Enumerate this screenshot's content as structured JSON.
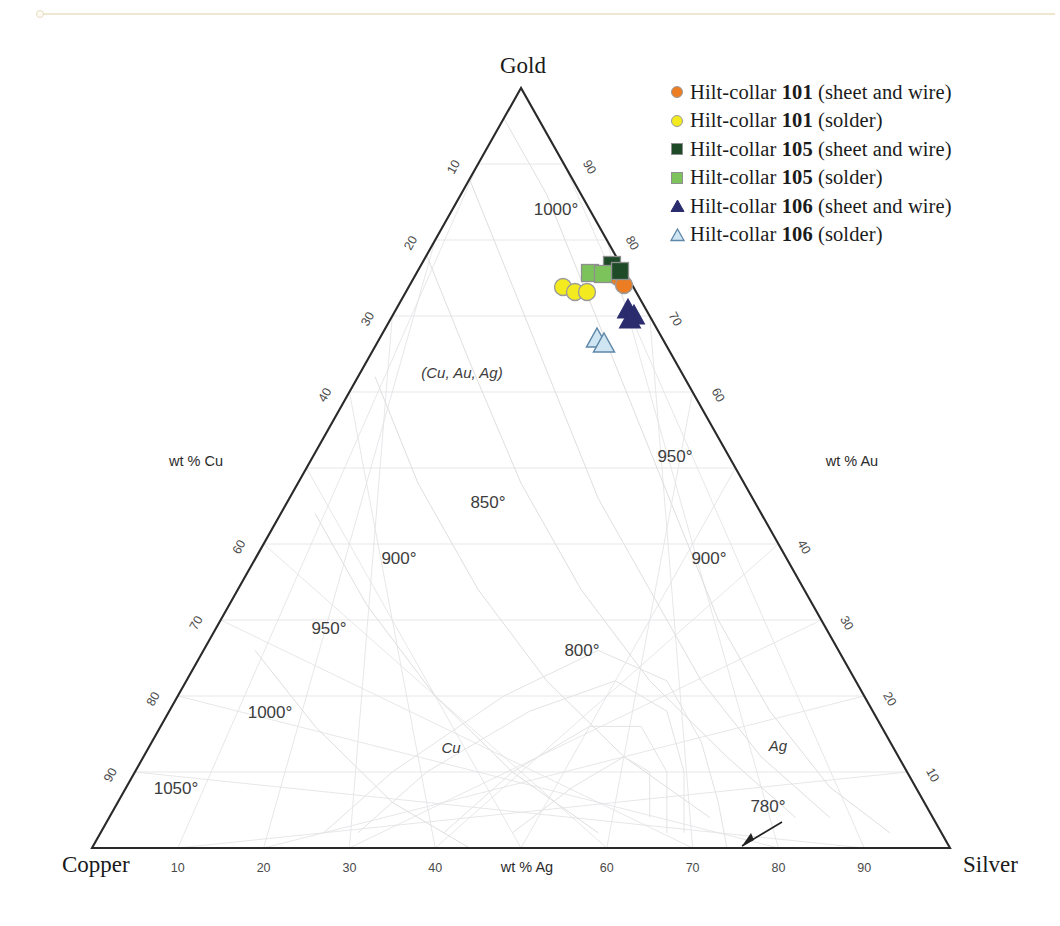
{
  "chart_data": {
    "type": "scatter",
    "plot_kind": "ternary",
    "title": "",
    "corners": {
      "top": "Gold",
      "bottom_left": "Copper",
      "bottom_right": "Silver"
    },
    "axes": [
      {
        "name": "left",
        "label": "wt % Cu",
        "ticks": [
          10,
          20,
          30,
          40,
          60,
          70,
          80,
          90
        ]
      },
      {
        "name": "right",
        "label": "wt % Au",
        "ticks": [
          10,
          20,
          30,
          40,
          60,
          70,
          80,
          90
        ]
      },
      {
        "name": "bottom",
        "label": "wt % Ag",
        "ticks": [
          10,
          20,
          30,
          40,
          60,
          70,
          80,
          90
        ]
      }
    ],
    "isotherm_labels": [
      {
        "text": "1000°",
        "x": 556,
        "y": 215
      },
      {
        "text": "950°",
        "x": 675,
        "y": 462
      },
      {
        "text": "850°",
        "x": 488,
        "y": 508
      },
      {
        "text": "900°",
        "x": 399,
        "y": 564
      },
      {
        "text": "900°",
        "x": 709,
        "y": 564
      },
      {
        "text": "950°",
        "x": 329,
        "y": 634
      },
      {
        "text": "800°",
        "x": 582,
        "y": 656
      },
      {
        "text": "1000°",
        "x": 270,
        "y": 718
      },
      {
        "text": "1050°",
        "x": 176,
        "y": 794
      },
      {
        "text": "780°",
        "x": 768,
        "y": 812
      }
    ],
    "phase_labels": [
      {
        "text": "(Cu, Au, Ag)",
        "x": 462,
        "y": 378
      },
      {
        "text": "Cu",
        "x": 451,
        "y": 753
      },
      {
        "text": "Ag",
        "x": 778,
        "y": 751
      }
    ],
    "legend_position": "top-right",
    "legend": [
      {
        "label_prefix": "Hilt-collar ",
        "label_bold": "101",
        "label_suffix": " (sheet and wire)",
        "marker": "circle",
        "fill": "#ED7D22",
        "stroke": "#9a9a9a",
        "series": "hilt-collar-101-sheet-and-wire"
      },
      {
        "label_prefix": "Hilt-collar ",
        "label_bold": "101",
        "label_suffix": " (solder)",
        "marker": "circle",
        "fill": "#F3EB1F",
        "stroke": "#9a9a9a",
        "series": "hilt-collar-101-solder"
      },
      {
        "label_prefix": "Hilt-collar ",
        "label_bold": "105",
        "label_suffix": " (sheet and wire)",
        "marker": "square",
        "fill": "#1E4A27",
        "stroke": "#8f8f8f",
        "series": "hilt-collar-105-sheet-and-wire"
      },
      {
        "label_prefix": "Hilt-collar ",
        "label_bold": "105",
        "label_suffix": " (solder)",
        "marker": "square",
        "fill": "#7CC35B",
        "stroke": "#8f8f8f",
        "series": "hilt-collar-105-solder"
      },
      {
        "label_prefix": "Hilt-collar ",
        "label_bold": "106",
        "label_suffix": " (sheet and wire)",
        "marker": "triangle",
        "fill": "#2B2C6E",
        "stroke": "#2B2C6E",
        "series": "hilt-collar-106-sheet-and-wire"
      },
      {
        "label_prefix": "Hilt-collar ",
        "label_bold": "106",
        "label_suffix": " (solder)",
        "marker": "triangle-open",
        "fill": "#CFE6F2",
        "stroke": "#5E87A8",
        "series": "hilt-collar-106-solder"
      }
    ],
    "series": [
      {
        "name": "Hilt-collar 101 (sheet and wire)",
        "marker": "circle",
        "fill": "#ED7D22",
        "stroke": "#9a9a9a",
        "points": [
          {
            "px": 618,
            "py": 277,
            "Ag": 17,
            "Au": 73,
            "Cu": 10
          },
          {
            "px": 624,
            "py": 285,
            "Ag": 18,
            "Au": 72,
            "Cu": 10
          }
        ]
      },
      {
        "name": "Hilt-collar 101 (solder)",
        "marker": "circle",
        "fill": "#F3EB1F",
        "stroke": "#9a9a9a",
        "points": [
          {
            "px": 563,
            "py": 287,
            "Ag": 13,
            "Au": 72,
            "Cu": 15
          },
          {
            "px": 575,
            "py": 292,
            "Ag": 14,
            "Au": 71,
            "Cu": 15
          },
          {
            "px": 587,
            "py": 292,
            "Ag": 15,
            "Au": 71,
            "Cu": 14
          }
        ]
      },
      {
        "name": "Hilt-collar 105 (sheet and wire)",
        "marker": "square",
        "fill": "#1E4A27",
        "stroke": "#8f8f8f",
        "points": [
          {
            "px": 612,
            "py": 265,
            "Ag": 17,
            "Au": 74,
            "Cu": 9
          },
          {
            "px": 620,
            "py": 271,
            "Ag": 18,
            "Au": 73,
            "Cu": 9
          }
        ]
      },
      {
        "name": "Hilt-collar 105 (solder)",
        "marker": "square",
        "fill": "#7CC35B",
        "stroke": "#8f8f8f",
        "points": [
          {
            "px": 590,
            "py": 273,
            "Ag": 15,
            "Au": 74,
            "Cu": 11
          },
          {
            "px": 603,
            "py": 274,
            "Ag": 16,
            "Au": 73,
            "Cu": 11
          }
        ]
      },
      {
        "name": "Hilt-collar 106 (sheet and wire)",
        "marker": "triangle",
        "fill": "#2B2C6E",
        "stroke": "#2B2C6E",
        "points": [
          {
            "px": 628,
            "py": 310,
            "Ag": 19,
            "Au": 69,
            "Cu": 12
          },
          {
            "px": 634,
            "py": 316,
            "Ag": 20,
            "Au": 68,
            "Cu": 12
          },
          {
            "px": 630,
            "py": 320,
            "Ag": 19,
            "Au": 68,
            "Cu": 13
          }
        ]
      },
      {
        "name": "Hilt-collar 106 (solder)",
        "marker": "triangle-open",
        "fill": "#CFE6F2",
        "stroke": "#5E87A8",
        "points": [
          {
            "px": 597,
            "py": 339,
            "Ag": 16,
            "Au": 67,
            "Cu": 17
          },
          {
            "px": 604,
            "py": 344,
            "Ag": 17,
            "Au": 66,
            "Cu": 17
          }
        ]
      }
    ]
  },
  "colors": {
    "edge": "#2a2a2a",
    "grid": "#e3e3e6",
    "text": "#1a1a1a",
    "accent_rule": "#efe6cf"
  }
}
